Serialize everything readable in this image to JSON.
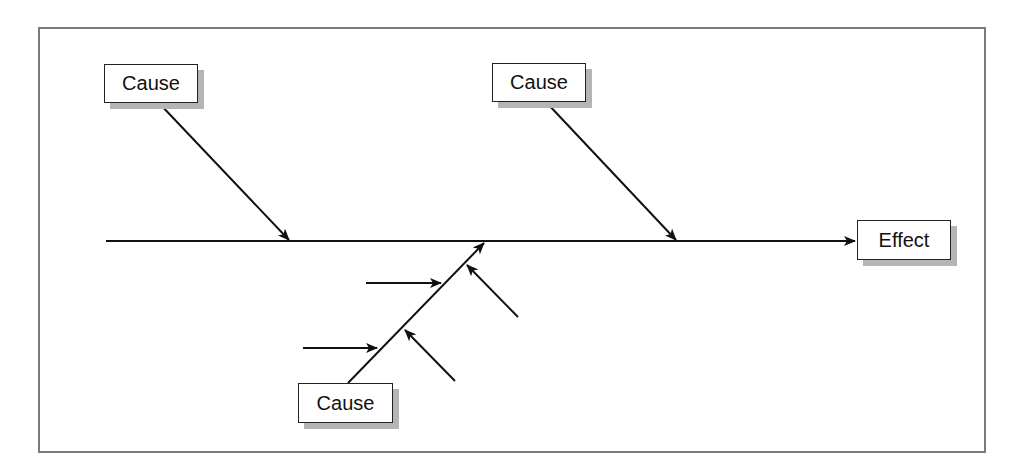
{
  "diagram": {
    "type": "fishbone (cause-and-effect)",
    "effect": {
      "label": "Effect"
    },
    "causes": [
      {
        "label": "Cause",
        "position": "top-left"
      },
      {
        "label": "Cause",
        "position": "top-center"
      },
      {
        "label": "Cause",
        "position": "bottom-center",
        "sub_causes": 4
      }
    ]
  },
  "colors": {
    "line": "#111111",
    "shadow": "#b5b5b5",
    "frame": "#7a7a7a"
  }
}
